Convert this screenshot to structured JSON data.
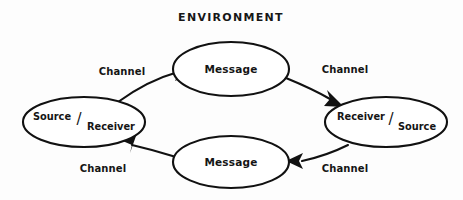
{
  "diagram": {
    "title": "ENVIRONMENT",
    "type": "communication-model-cycle",
    "background_color": "#fdfdfd",
    "stroke_color": "#111111",
    "text_color": "#151515",
    "nodes": [
      {
        "id": "left-party",
        "kind": "role-node",
        "numerator": "Source",
        "slash": "/",
        "denominator": "Receiver",
        "full_label": "Source/Receiver",
        "cx": 84,
        "cy": 122,
        "rx": 61,
        "ry": 25
      },
      {
        "id": "top-message",
        "kind": "message-node",
        "label": "Message",
        "cx": 231,
        "cy": 69,
        "rx": 58,
        "ry": 27
      },
      {
        "id": "right-party",
        "kind": "role-node",
        "numerator": "Receiver",
        "slash": "/",
        "denominator": "Source",
        "full_label": "Receiver/Source",
        "cx": 386,
        "cy": 122,
        "rx": 61,
        "ry": 25
      },
      {
        "id": "bottom-message",
        "kind": "message-node",
        "label": "Message",
        "cx": 231,
        "cy": 162,
        "rx": 58,
        "ry": 26
      }
    ],
    "edges": [
      {
        "id": "edge-top-left",
        "label": "Channel",
        "from": "left-party",
        "to": "top-message",
        "direction": "clockwise",
        "label_x": 122,
        "label_y": 75
      },
      {
        "id": "edge-top-right",
        "label": "Channel",
        "from": "top-message",
        "to": "right-party",
        "direction": "clockwise",
        "label_x": 345,
        "label_y": 73
      },
      {
        "id": "edge-bottom-right",
        "label": "Channel",
        "from": "right-party",
        "to": "bottom-message",
        "direction": "clockwise",
        "label_x": 345,
        "label_y": 172
      },
      {
        "id": "edge-bottom-left",
        "label": "Channel",
        "from": "bottom-message",
        "to": "left-party",
        "direction": "clockwise",
        "label_x": 103,
        "label_y": 172
      }
    ]
  }
}
